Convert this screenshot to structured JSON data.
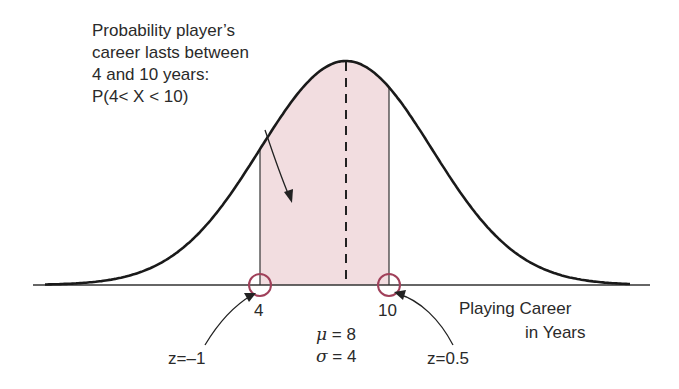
{
  "chart_data": {
    "type": "area",
    "title": "",
    "distribution": "normal",
    "mean": 8,
    "sd": 4,
    "shaded_interval": [
      4,
      10
    ],
    "xlabel": "Playing Career in Years",
    "ylabel": "",
    "x_ticks": [
      4,
      10
    ],
    "x_tick_labels": [
      "4",
      "10"
    ],
    "z_scores": [
      {
        "x": 4,
        "z": -1,
        "label": "z=–1"
      },
      {
        "x": 10,
        "z": 0.5,
        "label": "z=0.5"
      }
    ],
    "mean_line": {
      "x": 8,
      "style": "dashed"
    },
    "grid": false,
    "legend": null,
    "annotation": "Probability player's career lasts between 4 and 10 years: P(4< X < 10)"
  },
  "annotation": {
    "lines": [
      "Probability player’s",
      "career lasts between",
      "4 and 10 years:",
      "P(4< X < 10)"
    ]
  },
  "axis": {
    "label_line1": "Playing Career",
    "label_line2": "in Years",
    "tick_left": "4",
    "tick_right": "10"
  },
  "params": {
    "mu_symbol": "μ",
    "mu_text": " = 8",
    "sigma_symbol": "σ",
    "sigma_text": " = 4"
  },
  "zscores": {
    "left": "z=–1",
    "right": "z=0.5"
  },
  "colors": {
    "shade": "#f2dde0",
    "curve": "#1a1a1a",
    "circle": "#a0405a",
    "axis": "#333333"
  }
}
